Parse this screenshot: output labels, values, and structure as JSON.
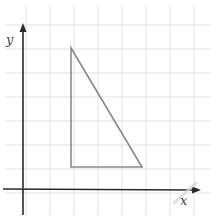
{
  "diagram": {
    "type": "coordinate-plane-triangle",
    "axes": {
      "x_label": "x",
      "y_label": "y",
      "color": "#2a2a2a"
    },
    "grid": {
      "color": "#e2e2e2",
      "spacing_px": 24
    },
    "triangle": {
      "color": "#8a8a8a",
      "vertices_grid": [
        [
          2,
          6
        ],
        [
          2,
          1
        ],
        [
          5,
          1
        ]
      ],
      "description": "Right triangle with vertical leg of 5 units and horizontal leg of 3 units"
    }
  }
}
